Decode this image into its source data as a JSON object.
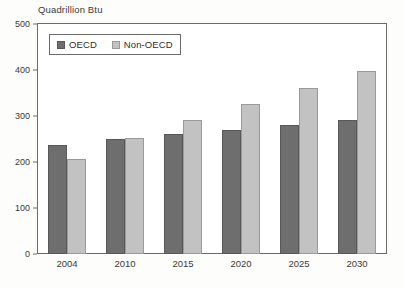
{
  "chart_data": {
    "type": "bar",
    "title": "Quadrillion Btu",
    "xlabel": "",
    "ylabel": "Quadrillion Btu",
    "categories": [
      "2004",
      "2010",
      "2015",
      "2020",
      "2025",
      "2030"
    ],
    "series": [
      {
        "name": "OECD",
        "color": "#6e6e6e",
        "values": [
          237,
          250,
          260,
          270,
          281,
          291
        ]
      },
      {
        "name": "Non-OECD",
        "color": "#c2c2c2",
        "values": [
          206,
          253,
          291,
          327,
          361,
          397
        ]
      }
    ],
    "ylim": [
      0,
      500
    ],
    "yticks": [
      0,
      100,
      200,
      300,
      400,
      500
    ],
    "ytick_labels": [
      "0",
      "100",
      "200",
      "300",
      "400",
      "500"
    ],
    "grid": false,
    "legend_position": "top-left",
    "legend_entries": [
      "OECD",
      "Non-OECD"
    ]
  }
}
